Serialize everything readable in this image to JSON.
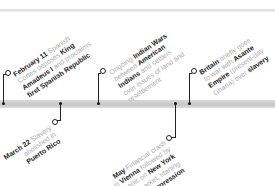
{
  "timeline": {
    "top_events": [
      {
        "date": "February 11",
        "lines": [
          [
            {
              "t": "February 11",
              "b": true
            },
            {
              "t": " Spanish",
              "b": false
            }
          ],
          [
            {
              "t": "Cortes deposes ",
              "b": false
            },
            {
              "t": "King",
              "b": true
            }
          ],
          [
            {
              "t": "Amadeus I",
              "b": true
            },
            {
              "t": " and proclaims",
              "b": false
            }
          ],
          [
            {
              "t": "first Spanish Republic",
              "b": true
            }
          ]
        ]
      },
      {
        "date": "",
        "lines": [
          [
            {
              "t": "Ongoing ",
              "b": false
            },
            {
              "t": "Indian Wars",
              "b": true
            }
          ],
          [
            {
              "t": "between ",
              "b": false
            },
            {
              "t": "American",
              "b": true
            }
          ],
          [
            {
              "t": "Indians",
              "b": true
            },
            {
              "t": " and settlers",
              "b": false
            }
          ],
          [
            {
              "t": "over issues of land and",
              "b": false
            }
          ],
          [
            {
              "t": "resettlement",
              "b": false
            }
          ]
        ]
      },
      {
        "date": "",
        "lines": [
          [
            {
              "t": "Britain",
              "b": true
            },
            {
              "t": " briefly goes",
              "b": false
            }
          ],
          [
            {
              "t": "to war with ",
              "b": false
            },
            {
              "t": "Asante",
              "b": true
            }
          ],
          [
            {
              "t": "Empire",
              "b": true
            },
            {
              "t": " (present-day",
              "b": false
            }
          ],
          [
            {
              "t": "Ghana) over ",
              "b": false
            },
            {
              "t": "slavery",
              "b": true
            }
          ]
        ]
      }
    ],
    "bottom_events": [
      {
        "date": "March 22",
        "lines": [
          [
            {
              "t": "March 22",
              "b": true
            },
            {
              "t": " Slavery",
              "b": false
            }
          ],
          [
            {
              "t": "abolished in",
              "b": false
            }
          ],
          [
            {
              "t": "Puerto Rico",
              "b": true
            }
          ]
        ]
      },
      {
        "date": "May",
        "lines": [
          [
            {
              "t": "May",
              "b": true
            },
            {
              "t": " Financial crash",
              "b": false
            }
          ],
          [
            {
              "t": "in ",
              "b": false
            },
            {
              "t": "Vienna",
              "b": true
            },
            {
              "t": " followed by",
              "b": false
            }
          ],
          [
            {
              "t": "later panic on ",
              "b": false
            },
            {
              "t": "New York",
              "b": true
            }
          ],
          [
            {
              "t": "stock market, starting",
              "b": false
            }
          ],
          [
            {
              "t": "Long Depression",
              "b": true
            }
          ]
        ]
      }
    ]
  },
  "colors": {
    "bar": "#cfcfcf",
    "text_muted": "#aaaaaa",
    "text_bold": "#222222",
    "marker": "#222222"
  }
}
